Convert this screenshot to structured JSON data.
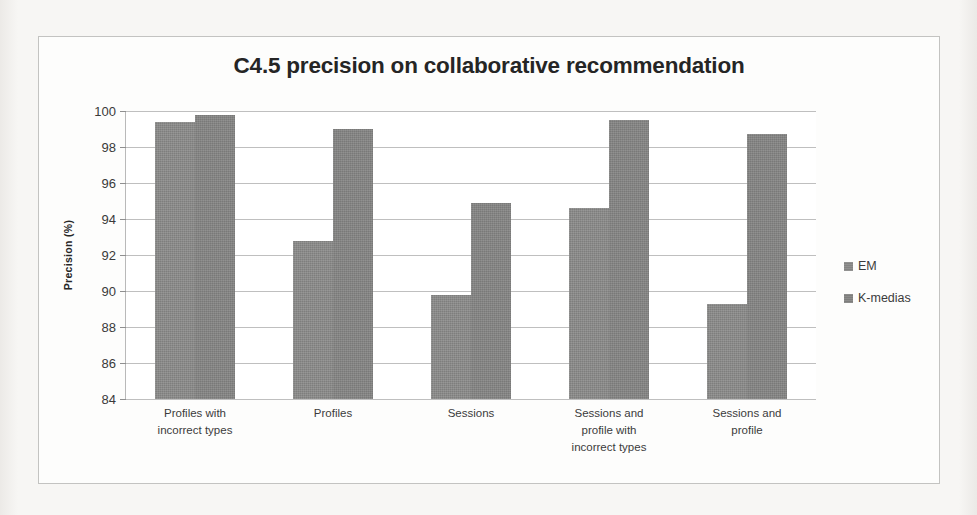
{
  "chart_data": {
    "type": "bar",
    "title": "C4.5 precision on collaborative recommendation",
    "xlabel": "",
    "ylabel": "Precision (%)",
    "ylim": [
      84,
      100
    ],
    "ytick_step": 2,
    "yticks": [
      100,
      98,
      96,
      94,
      92,
      90,
      88,
      86,
      84
    ],
    "ytick_labels": [
      "100",
      "98",
      "96",
      "94",
      "92",
      "90",
      "88",
      "86",
      "84"
    ],
    "grid": true,
    "legend_position": "right",
    "categories": [
      "Profiles with incorrect types",
      "Profiles",
      "Sessions",
      "Sessions and profile with incorrect types",
      "Sessions and profile"
    ],
    "category_lines": [
      [
        "Profiles with",
        "incorrect types"
      ],
      [
        "Profiles"
      ],
      [
        "Sessions"
      ],
      [
        "Sessions and",
        "profile with",
        "incorrect types"
      ],
      [
        "Sessions and",
        "profile"
      ]
    ],
    "series": [
      {
        "name": "EM",
        "color": "#8b8b8a",
        "values": [
          99.4,
          92.8,
          89.8,
          94.6,
          89.3
        ]
      },
      {
        "name": "K-medias",
        "color": "#858584",
        "values": [
          99.8,
          99.0,
          94.9,
          99.5,
          98.7
        ]
      }
    ]
  },
  "legend": {
    "items": [
      {
        "label": "EM",
        "color": "#8b8b8a"
      },
      {
        "label": "K-medias",
        "color": "#858584"
      }
    ]
  },
  "colors": {
    "page_background": "#f4f3f1",
    "frame_background": "#fdfdfc",
    "frame_border": "#c3c3c1",
    "gridline": "#bfbfbf",
    "title_text": "#252525",
    "axis_text": "#3a3a3a",
    "bar_fill": "#888887"
  }
}
